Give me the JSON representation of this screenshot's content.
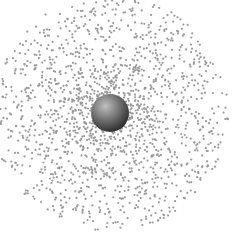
{
  "diagram": {
    "type": "electron-cloud",
    "width": 238,
    "height": 234,
    "background": "#ffffff",
    "nucleus": {
      "cx": 110,
      "cy": 113,
      "r": 19,
      "highlight_color": "#bfbfbf",
      "mid_color": "#6e6e6e",
      "shadow_color": "#2e2e2e"
    },
    "cloud": {
      "dot_color": "#9a9a9a",
      "dot_radius": 1.1,
      "dot_count": 1600,
      "max_radius": 118,
      "seed": 7
    }
  }
}
